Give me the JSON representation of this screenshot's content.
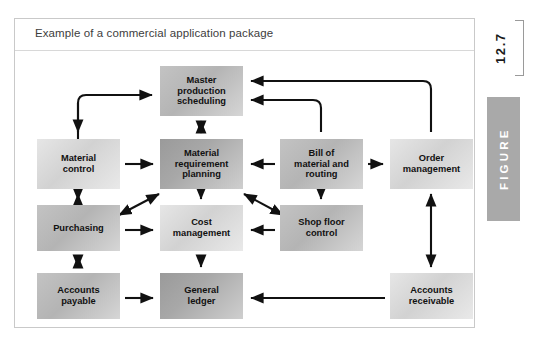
{
  "figure": {
    "caption": "Example of a commercial application package",
    "number": "12.7",
    "word": "FIGURE",
    "accent_bar_color": "#a9a9a9",
    "frame_border_color": "#c9c9c9"
  },
  "diagram": {
    "type": "flowchart",
    "nodes": [
      {
        "id": "mps",
        "label": "Master\nproduction\nscheduling",
        "x": 145,
        "y": 15,
        "w": 83,
        "h": 50,
        "tone": "mid"
      },
      {
        "id": "mc",
        "label": "Material\ncontrol",
        "x": 22,
        "y": 88,
        "w": 83,
        "h": 50,
        "tone": "light"
      },
      {
        "id": "mrp",
        "label": "Material\nrequirement\nplanning",
        "x": 145,
        "y": 88,
        "w": 83,
        "h": 50,
        "tone": "dark"
      },
      {
        "id": "bom",
        "label": "Bill of\nmaterial and\nrouting",
        "x": 265,
        "y": 88,
        "w": 83,
        "h": 50,
        "tone": "mid"
      },
      {
        "id": "om",
        "label": "Order\nmanagement",
        "x": 375,
        "y": 88,
        "w": 83,
        "h": 50,
        "tone": "light"
      },
      {
        "id": "pur",
        "label": "Purchasing",
        "x": 22,
        "y": 154,
        "w": 83,
        "h": 46,
        "tone": "mid"
      },
      {
        "id": "cm",
        "label": "Cost\nmanagement",
        "x": 145,
        "y": 154,
        "w": 83,
        "h": 46,
        "tone": "light"
      },
      {
        "id": "sfc",
        "label": "Shop floor\ncontrol",
        "x": 265,
        "y": 154,
        "w": 83,
        "h": 46,
        "tone": "mid"
      },
      {
        "id": "ap",
        "label": "Accounts\npayable",
        "x": 22,
        "y": 222,
        "w": 83,
        "h": 46,
        "tone": "mid"
      },
      {
        "id": "gl",
        "label": "General\nledger",
        "x": 145,
        "y": 222,
        "w": 83,
        "h": 46,
        "tone": "dark"
      },
      {
        "id": "ar",
        "label": "Accounts\nreceivable",
        "x": 375,
        "y": 222,
        "w": 83,
        "h": 46,
        "tone": "light"
      }
    ],
    "edges": [
      {
        "from": "left-elbow",
        "to": "mps",
        "style": "elbow",
        "direction": "one-way"
      },
      {
        "from": "left-elbow",
        "to": "mc",
        "style": "elbow",
        "direction": "one-way"
      },
      {
        "from": "om",
        "to": "mps",
        "style": "elbow",
        "direction": "one-way"
      },
      {
        "from": "bom",
        "to": "mps",
        "style": "elbow",
        "direction": "one-way"
      },
      {
        "from": "mps",
        "to": "mrp",
        "style": "straight",
        "direction": "two-way"
      },
      {
        "from": "mc",
        "to": "mrp",
        "style": "straight",
        "direction": "one-way"
      },
      {
        "from": "bom",
        "to": "mrp",
        "style": "straight",
        "direction": "one-way"
      },
      {
        "from": "bom",
        "to": "om",
        "style": "straight",
        "direction": "one-way"
      },
      {
        "from": "bom",
        "to": "sfc",
        "style": "straight",
        "direction": "one-way"
      },
      {
        "from": "mc",
        "to": "pur",
        "style": "straight",
        "direction": "two-way"
      },
      {
        "from": "mrp",
        "to": "pur",
        "style": "diagonal",
        "direction": "two-way"
      },
      {
        "from": "mrp",
        "to": "cm",
        "style": "straight",
        "direction": "one-way"
      },
      {
        "from": "mrp",
        "to": "sfc",
        "style": "diagonal",
        "direction": "two-way"
      },
      {
        "from": "pur",
        "to": "cm",
        "style": "straight",
        "direction": "one-way"
      },
      {
        "from": "sfc",
        "to": "cm",
        "style": "straight",
        "direction": "one-way"
      },
      {
        "from": "pur",
        "to": "ap",
        "style": "straight",
        "direction": "two-way"
      },
      {
        "from": "cm",
        "to": "gl",
        "style": "straight",
        "direction": "one-way"
      },
      {
        "from": "ap",
        "to": "gl",
        "style": "straight",
        "direction": "one-way"
      },
      {
        "from": "ar",
        "to": "gl",
        "style": "straight",
        "direction": "one-way"
      },
      {
        "from": "om",
        "to": "ar",
        "style": "straight",
        "direction": "two-way"
      }
    ]
  }
}
